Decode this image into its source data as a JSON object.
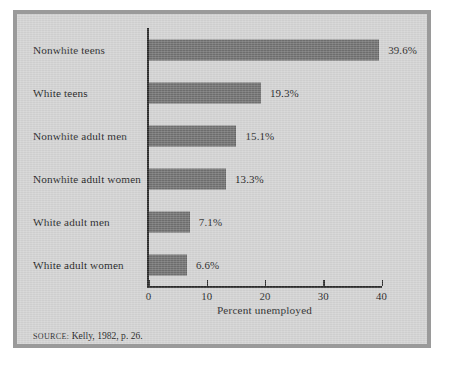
{
  "figure": {
    "source_note_prefix": "Source:",
    "source_note_text": " Kelly, 1982, p. 26.",
    "frame_color": "#9a9a9a",
    "background_color": "#d2d2d2",
    "bar_color": "#6f6f6f",
    "axis_color": "#2b2b2b"
  },
  "chart_data": {
    "type": "bar",
    "orientation": "horizontal",
    "title": "",
    "subtitle": "",
    "xlabel": "Percent unemployed",
    "ylabel": "",
    "xlim": [
      0,
      40
    ],
    "ylim": null,
    "grid": false,
    "legend": null,
    "xticks": [
      0,
      10,
      20,
      30,
      40
    ],
    "xtick_labels": [
      "0",
      "10",
      "20",
      "30",
      "40"
    ],
    "categories": [
      "Nonwhite teens",
      "White teens",
      "Nonwhite adult men",
      "Nonwhite adult women",
      "White adult men",
      "White adult women"
    ],
    "values": [
      39.6,
      19.3,
      15.1,
      13.3,
      7.1,
      6.6
    ],
    "data_labels": [
      "39.6%",
      "19.3%",
      "15.1%",
      "13.3%",
      "7.1%",
      "6.6%"
    ],
    "annotations": [
      "Source: Kelly, 1982, p. 26."
    ]
  }
}
